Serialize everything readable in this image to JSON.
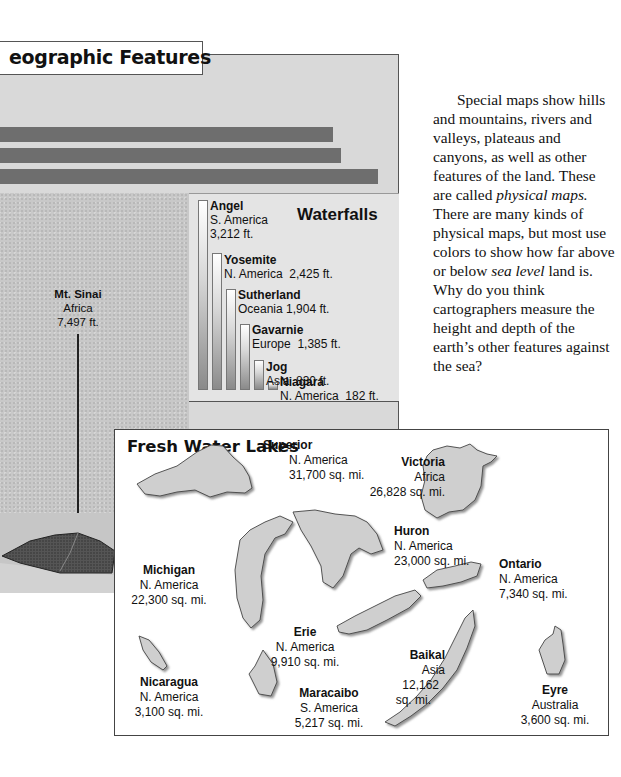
{
  "geographic_features": {
    "title": "eographic Features",
    "bars": [
      {
        "width": 333
      },
      {
        "width": 341
      },
      {
        "width": 378
      }
    ]
  },
  "mountain": {
    "name": "Mt. Sinai",
    "continent": "Africa",
    "height": "7,497 ft."
  },
  "waterfalls": {
    "title": "Waterfalls",
    "items": [
      {
        "name": "Angel",
        "continent": "S. America",
        "height": "3,212 ft."
      },
      {
        "name": "Yosemite",
        "continent": "N. America",
        "height": "2,425 ft."
      },
      {
        "name": "Sutherland",
        "continent": "Oceania",
        "height": "1,904 ft."
      },
      {
        "name": "Gavarnie",
        "continent": "Europe",
        "height": "1,385 ft."
      },
      {
        "name": "Jog",
        "continent": "Asia",
        "height": "830 ft."
      },
      {
        "name": "Niagara",
        "continent": "N. America",
        "height": "182 ft."
      }
    ]
  },
  "paragraph": {
    "text_1": "Special maps show hills and mountains, rivers and valleys, plateaus and canyons, as well as other features of the land. These are called ",
    "italic_1": "physical maps.",
    "text_2": " There are many kinds of physical maps, but most use colors to show how far above or below ",
    "italic_2": "sea level",
    "text_3": " land is. Why do you think cartographers measure the height and depth of the earth’s other features against the sea?"
  },
  "lakes": {
    "title": "Fresh Water Lakes",
    "items": [
      {
        "name": "Superior",
        "continent": "N. America",
        "area": "31,700 sq. mi."
      },
      {
        "name": "Victoria",
        "continent": "Africa",
        "area": "26,828 sq. mi."
      },
      {
        "name": "Huron",
        "continent": "N. America",
        "area": "23,000 sq. mi."
      },
      {
        "name": "Michigan",
        "continent": "N. America",
        "area": "22,300 sq. mi."
      },
      {
        "name": "Ontario",
        "continent": "N. America",
        "area": "7,340 sq. mi."
      },
      {
        "name": "Erie",
        "continent": "N. America",
        "area": "9,910 sq. mi."
      },
      {
        "name": "Baikal",
        "continent": "Asia",
        "area_line1": "12,162",
        "area_line2": "sq. mi."
      },
      {
        "name": "Nicaragua",
        "continent": "N. America",
        "area": "3,100 sq. mi."
      },
      {
        "name": "Maracaibo",
        "continent": "S. America",
        "area": "5,217 sq. mi."
      },
      {
        "name": "Eyre",
        "continent": "Australia",
        "area": "3,600 sq. mi."
      }
    ]
  },
  "colors": {
    "panel_gray": "#d9d9d9",
    "bar_gray": "#6e6e6e",
    "lake_fill": "#cfcfcf",
    "border": "#555555"
  }
}
